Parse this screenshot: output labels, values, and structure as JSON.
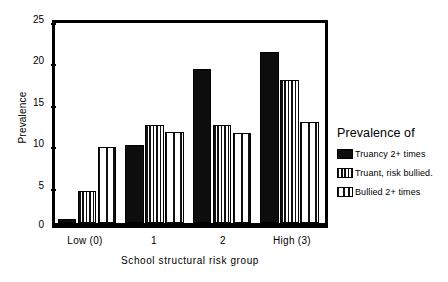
{
  "chart_data": {
    "type": "bar",
    "title": "",
    "xlabel": "School structural risk group",
    "ylabel": "Prevalence",
    "categories": [
      "Low (0)",
      "1",
      "2",
      "High (3)"
    ],
    "ylim": [
      0,
      25
    ],
    "yticks": [
      0,
      5,
      10,
      15,
      20,
      25
    ],
    "grid": false,
    "legend_title": "Prevalence of",
    "legend_position": "right",
    "series": [
      {
        "name": "Truancy 2+ times",
        "pattern": "solid-black",
        "values": [
          0.5,
          9.7,
          19.2,
          21.4
        ]
      },
      {
        "name": "Truant, risk bullied.",
        "pattern": "dense-vertical-stripes",
        "values": [
          4.0,
          12.3,
          12.2,
          17.9
        ]
      },
      {
        "name": "Bullied 2+ times",
        "pattern": "sparse-vertical-stripes",
        "values": [
          9.5,
          11.4,
          11.3,
          12.6
        ]
      }
    ]
  },
  "axis": {
    "y_tick_labels": [
      "25",
      "20",
      "15",
      "10",
      "5",
      "0"
    ],
    "y_title": "Prevalence",
    "x_title": "School structural risk group",
    "x_tick_labels": [
      "Low (0)",
      "1",
      "2",
      "High (3)"
    ]
  },
  "legend": {
    "title": "Prevalence of",
    "items": [
      {
        "label": "Truancy 2+ times",
        "pattern": "solid"
      },
      {
        "label": "Truant, risk bullied.",
        "pattern": "dense"
      },
      {
        "label": "Bullied 2+ times",
        "pattern": "sparse"
      }
    ]
  },
  "colors": {
    "ink": "#000000",
    "background": "#ffffff",
    "bar_solid": "#0d0d0d"
  }
}
